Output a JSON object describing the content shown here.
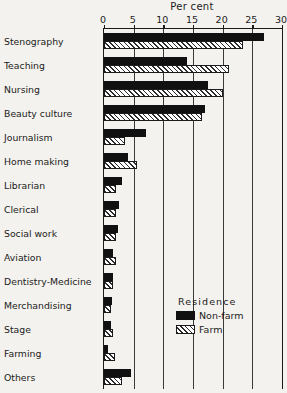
{
  "chart": {
    "axis_title": "Per cent",
    "tick_labels": [
      "0",
      "5",
      "10",
      "15",
      "20",
      "25",
      "30"
    ]
  },
  "legend": {
    "title": "Residence",
    "entries": [
      {
        "label": "Non-farm",
        "swatch": "solid-black-swatch",
        "color": "#111111"
      },
      {
        "label": "Farm",
        "swatch": "hatched-swatch",
        "color": "#ffffff"
      }
    ]
  },
  "chart_data": {
    "type": "bar",
    "orientation": "horizontal",
    "title": "",
    "xlabel": "Per cent",
    "ylabel": "",
    "xlim": [
      0,
      30
    ],
    "xticks": [
      0,
      5,
      10,
      15,
      20,
      25,
      30
    ],
    "grid": true,
    "legend_position": "inside-right-lower",
    "categories": [
      "Stenography",
      "Teaching",
      "Nursing",
      "Beauty culture",
      "Journalism",
      "Home making",
      "Librarian",
      "Clerical",
      "Social work",
      "Aviation",
      "Dentistry-Medicine",
      "Merchandising",
      "Stage",
      "Farming",
      "Others"
    ],
    "series": [
      {
        "name": "Non-farm",
        "values": [
          27.0,
          14.0,
          17.5,
          17.0,
          7.0,
          4.0,
          3.0,
          2.6,
          2.4,
          1.6,
          1.5,
          1.4,
          1.2,
          0.7,
          4.6
        ]
      },
      {
        "name": "Farm",
        "values": [
          23.5,
          21.0,
          20.0,
          16.5,
          3.5,
          5.6,
          2.0,
          2.0,
          2.0,
          2.0,
          1.5,
          1.1,
          1.5,
          1.8,
          3.0
        ]
      }
    ]
  }
}
